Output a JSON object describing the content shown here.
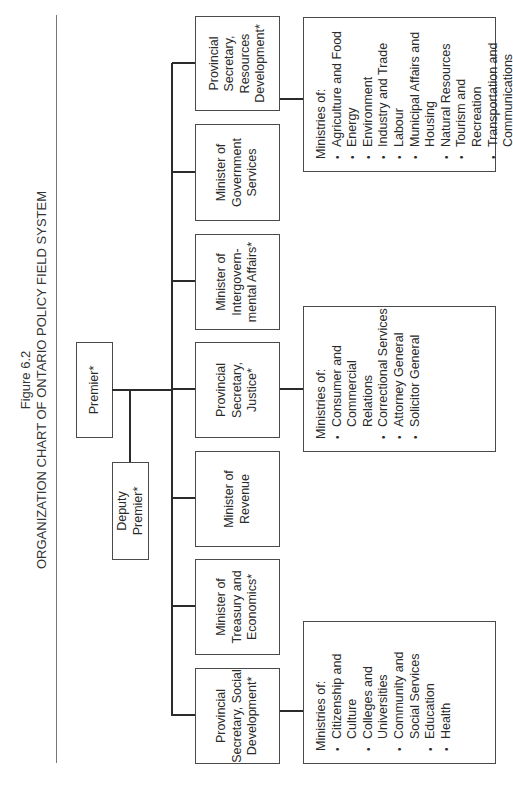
{
  "figure": {
    "number": "Figure 6.2",
    "title": "ORGANIZATION CHART OF ONTARIO POLICY FIELD SYSTEM"
  },
  "nodes": {
    "premier": "Premier*",
    "deputy_premier": [
      "Deputy",
      "Premier*"
    ],
    "ministers": [
      {
        "id": "ps-social",
        "lines": [
          "Provincial",
          "Secretary, Social",
          "Development*"
        ]
      },
      {
        "id": "treasury",
        "lines": [
          "Minister of",
          "Treasury and",
          "Economics*"
        ]
      },
      {
        "id": "revenue",
        "lines": [
          "Minister of",
          "Revenue"
        ]
      },
      {
        "id": "ps-justice",
        "lines": [
          "Provincial",
          "Secretary,",
          "Justice*"
        ]
      },
      {
        "id": "intergov",
        "lines": [
          "Minister of",
          "Intergovern-",
          "mental Affairs*"
        ]
      },
      {
        "id": "gov-services",
        "lines": [
          "Minister of",
          "Government",
          "Services"
        ]
      },
      {
        "id": "ps-resources",
        "lines": [
          "Provincial",
          "Secretary,",
          "Resources",
          "Development*"
        ]
      }
    ]
  },
  "ministries": {
    "social": {
      "heading": "Ministries of:",
      "items": [
        "Citizenship and Culture",
        "Colleges and Universities",
        "Community and Social Services",
        "Education",
        "Health"
      ]
    },
    "justice": {
      "heading": "Ministries of:",
      "items": [
        "Consumer and Commercial Relations",
        "Correctional Services",
        "Attorney General",
        "Solicitor General"
      ]
    },
    "resources": {
      "heading": "Ministries of:",
      "items": [
        "Agriculture and Food",
        "Energy",
        "Environment",
        "Industry and Trade",
        "Labour",
        "Municipal Affairs and Housing",
        "Natural Resources",
        "Tourism and Recreation",
        "Transportation and Communications"
      ]
    }
  },
  "colors": {
    "line": "#2b2b2b",
    "border": "#4a4a4a",
    "text": "#2a2a2a",
    "background": "#ffffff"
  }
}
